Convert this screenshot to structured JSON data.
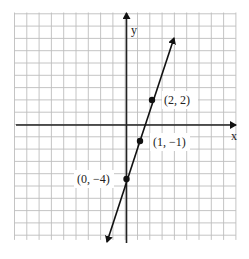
{
  "chart_data": {
    "type": "line",
    "title": "",
    "xlabel": "x",
    "ylabel": "y",
    "xlim": [
      -9,
      9
    ],
    "ylim": [
      -9,
      9
    ],
    "grid": true,
    "grid_step": 1,
    "series": [
      {
        "name": "y = 3x - 4",
        "equation": "y = 3x - 4",
        "line_extent": {
          "start": [
            -1.5,
            -9.5
          ],
          "end": [
            3.8,
            7.4
          ]
        },
        "arrows": "both",
        "points": [
          {
            "x": 2,
            "y": 2,
            "label": "(2, 2)"
          },
          {
            "x": 1,
            "y": -1,
            "label": "(1, −1)"
          },
          {
            "x": 0,
            "y": -4,
            "label": "(0, −4)"
          }
        ]
      }
    ],
    "legend": "none"
  },
  "labels": {
    "x_axis": "x",
    "y_axis": "y",
    "p1": "(2, 2)",
    "p2": "(1, −1)",
    "p3": "(0, −4)"
  },
  "colors": {
    "grid": "#bdbdbd",
    "axis": "#222222",
    "line": "#111111",
    "background": "#ffffff"
  }
}
